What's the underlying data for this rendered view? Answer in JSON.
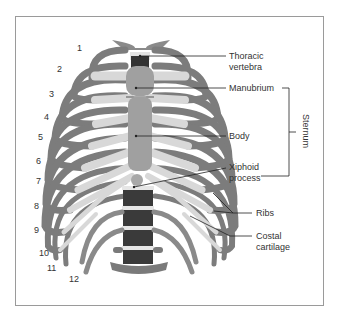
{
  "figure": {
    "labels": {
      "thoracic_vertebra_1": "Thoracic",
      "thoracic_vertebra_2": "vertebra",
      "manubrium": "Manubrium",
      "body": "Body",
      "xiphoid_1": "Xiphoid",
      "xiphoid_2": "process",
      "sternum": "Sternum",
      "ribs": "Ribs",
      "costal_1": "Costal",
      "costal_2": "cartilage"
    },
    "rib_numbers": [
      "1",
      "2",
      "3",
      "4",
      "5",
      "6",
      "7",
      "8",
      "9",
      "10",
      "11",
      "12"
    ],
    "colors": {
      "rib": "#7a7a7a",
      "rib_dark": "#5e5e5e",
      "cartilage": "#d6d6d6",
      "sternum": "#9c9c9c",
      "vertebra": "#3c3c3c",
      "disc": "#e8e8e8",
      "frame": "#9a9a9a"
    }
  }
}
